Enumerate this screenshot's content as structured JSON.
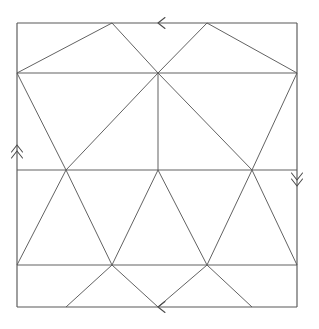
{
  "figure": {
    "background_color": "#ffffff",
    "line_color": "#4a4a4a",
    "canvas": {
      "width": 319,
      "height": 329
    },
    "square": {
      "left": 17,
      "top": 23,
      "right": 297,
      "bottom": 307
    },
    "caption": ""
  },
  "chart_data": {
    "type": "diagram",
    "xlabel": "",
    "ylabel": "",
    "coordinate_space": {
      "x_range": [
        0,
        319
      ],
      "y_range": [
        0,
        329
      ],
      "y_axis": "down"
    },
    "grid": false,
    "legend": "none",
    "vertices": [
      {
        "name": "corner-top-left",
        "x": 17,
        "y": 23
      },
      {
        "name": "corner-top-right",
        "x": 297,
        "y": 23
      },
      {
        "name": "corner-bottom-left",
        "x": 17,
        "y": 307
      },
      {
        "name": "corner-bottom-right",
        "x": 297,
        "y": 307
      },
      {
        "name": "left-upper",
        "x": 17,
        "y": 73
      },
      {
        "name": "right-upper",
        "x": 297,
        "y": 73
      },
      {
        "name": "left-middle",
        "x": 17,
        "y": 170
      },
      {
        "name": "right-middle",
        "x": 297,
        "y": 170
      },
      {
        "name": "left-lower",
        "x": 17,
        "y": 265
      },
      {
        "name": "right-lower",
        "x": 297,
        "y": 265
      },
      {
        "name": "apex-center",
        "x": 158,
        "y": 73
      },
      {
        "name": "hub-left",
        "x": 66,
        "y": 170
      },
      {
        "name": "hub-center",
        "x": 158,
        "y": 170
      },
      {
        "name": "hub-right",
        "x": 252,
        "y": 170
      },
      {
        "name": "lower-left-node",
        "x": 112,
        "y": 265
      },
      {
        "name": "lower-right-node",
        "x": 207,
        "y": 265
      },
      {
        "name": "top-edge-node-a",
        "x": 112,
        "y": 23
      },
      {
        "name": "top-edge-node-b",
        "x": 207,
        "y": 23
      },
      {
        "name": "bottom-edge-node-a",
        "x": 66,
        "y": 307
      },
      {
        "name": "bottom-edge-node-b",
        "x": 158,
        "y": 307
      },
      {
        "name": "bottom-edge-node-c",
        "x": 252,
        "y": 307
      }
    ],
    "segments": [
      {
        "name": "boundary-top",
        "x1": 17,
        "y1": 23,
        "x2": 297,
        "y2": 23
      },
      {
        "name": "boundary-right",
        "x1": 297,
        "y1": 23,
        "x2": 297,
        "y2": 307
      },
      {
        "name": "boundary-bottom",
        "x1": 17,
        "y1": 307,
        "x2": 297,
        "y2": 307
      },
      {
        "name": "boundary-left",
        "x1": 17,
        "y1": 23,
        "x2": 17,
        "y2": 307
      },
      {
        "name": "horizontal-upper",
        "x1": 17,
        "y1": 73,
        "x2": 297,
        "y2": 73
      },
      {
        "name": "horizontal-middle",
        "x1": 17,
        "y1": 170,
        "x2": 297,
        "y2": 170
      },
      {
        "name": "horizontal-lower",
        "x1": 17,
        "y1": 265,
        "x2": 297,
        "y2": 265
      },
      {
        "name": "vertical-center",
        "x1": 158,
        "y1": 73,
        "x2": 158,
        "y2": 170
      },
      {
        "name": "band1-diag-a",
        "x1": 17,
        "y1": 73,
        "x2": 112,
        "y2": 23
      },
      {
        "name": "band1-diag-b",
        "x1": 112,
        "y1": 23,
        "x2": 158,
        "y2": 73
      },
      {
        "name": "band1-diag-c",
        "x1": 158,
        "y1": 73,
        "x2": 207,
        "y2": 23
      },
      {
        "name": "band1-diag-d",
        "x1": 207,
        "y1": 23,
        "x2": 297,
        "y2": 73
      },
      {
        "name": "band2-diag-a",
        "x1": 17,
        "y1": 73,
        "x2": 66,
        "y2": 170
      },
      {
        "name": "band2-diag-b",
        "x1": 66,
        "y1": 170,
        "x2": 158,
        "y2": 73
      },
      {
        "name": "band2-diag-c",
        "x1": 158,
        "y1": 73,
        "x2": 252,
        "y2": 170
      },
      {
        "name": "band2-diag-d",
        "x1": 252,
        "y1": 170,
        "x2": 297,
        "y2": 73
      },
      {
        "name": "band3-diag-a",
        "x1": 17,
        "y1": 265,
        "x2": 66,
        "y2": 170
      },
      {
        "name": "band3-diag-b",
        "x1": 66,
        "y1": 170,
        "x2": 112,
        "y2": 265
      },
      {
        "name": "band3-diag-c",
        "x1": 112,
        "y1": 265,
        "x2": 158,
        "y2": 170
      },
      {
        "name": "band3-diag-d",
        "x1": 158,
        "y1": 170,
        "x2": 207,
        "y2": 265
      },
      {
        "name": "band3-diag-e",
        "x1": 207,
        "y1": 265,
        "x2": 252,
        "y2": 170
      },
      {
        "name": "band3-diag-f",
        "x1": 252,
        "y1": 170,
        "x2": 297,
        "y2": 265
      },
      {
        "name": "band4-diag-a",
        "x1": 66,
        "y1": 307,
        "x2": 112,
        "y2": 265
      },
      {
        "name": "band4-diag-b",
        "x1": 112,
        "y1": 265,
        "x2": 158,
        "y2": 307
      },
      {
        "name": "band4-diag-c",
        "x1": 158,
        "y1": 307,
        "x2": 207,
        "y2": 265
      },
      {
        "name": "band4-diag-d",
        "x1": 207,
        "y1": 265,
        "x2": 252,
        "y2": 307
      }
    ],
    "edge_markers": [
      {
        "name": "top-edge-marker",
        "glyph": "single-chevron",
        "direction": "left",
        "count": 1,
        "x": 158,
        "y": 23
      },
      {
        "name": "bottom-edge-marker",
        "glyph": "single-chevron",
        "direction": "left",
        "count": 1,
        "x": 158,
        "y": 307
      },
      {
        "name": "left-edge-marker",
        "glyph": "double-chevron",
        "direction": "up",
        "count": 2,
        "x": 17,
        "y": 145
      },
      {
        "name": "right-edge-marker",
        "glyph": "double-chevron",
        "direction": "down",
        "count": 2,
        "x": 297,
        "y": 186
      }
    ],
    "annotations": []
  }
}
